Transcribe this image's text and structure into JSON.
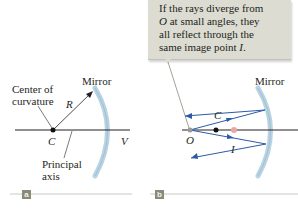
{
  "figure": {
    "panel_a": {
      "tag": "a",
      "labels": {
        "mirror": "Mirror",
        "center_of_curvature_line1": "Center of",
        "center_of_curvature_line2": "curvature",
        "radius": "R",
        "center": "C",
        "vertex": "V",
        "principal_axis_line1": "Principal",
        "principal_axis_line2": "axis"
      }
    },
    "panel_b": {
      "tag": "b",
      "callout_text": "If the rays diverge from O at small angles, they all reflect through the same image point I.",
      "callout_lines": [
        "If the rays diverge from",
        "O at small angles, they",
        "all reflect through the",
        "same image point I."
      ],
      "labels": {
        "mirror": "Mirror",
        "center": "C",
        "object": "O",
        "image": "I"
      }
    },
    "colors": {
      "mirror_fill": "#b9d3e2",
      "ray_blue": "#2c5aa8",
      "axis_black": "#231f20",
      "callout_bg": "#dcdcd2",
      "object_point": "#9a9a9a",
      "image_point": "#e8a8a0",
      "tag_bg": "#8a8a7a"
    }
  }
}
